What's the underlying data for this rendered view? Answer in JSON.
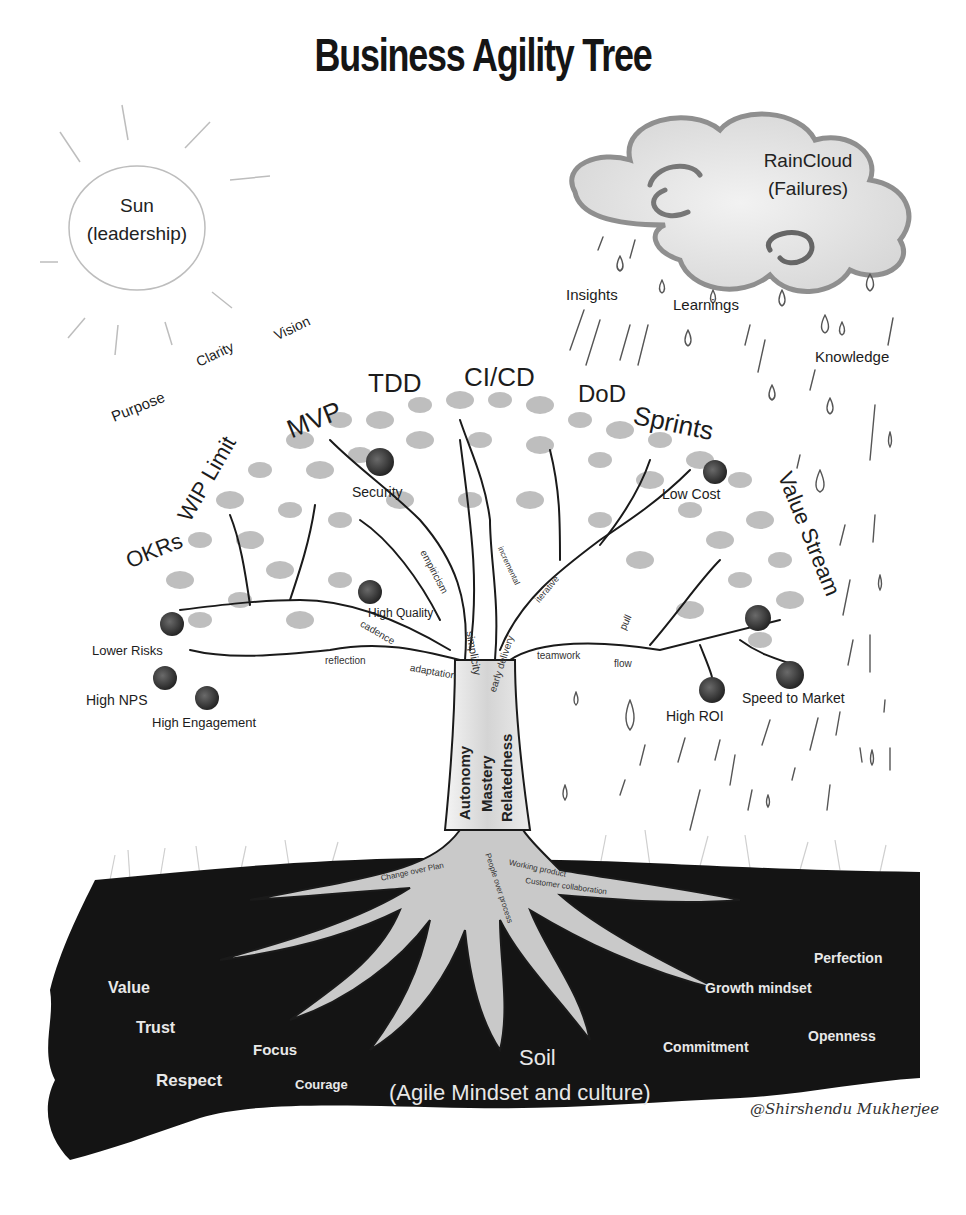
{
  "title": "Business Agility Tree",
  "colors": {
    "background": "#ffffff",
    "ink": "#1a1a1a",
    "foliage": "#a8a8a8",
    "fruit": "#333333",
    "soil": "#141414",
    "soil_text": "#e8e8e8",
    "root": "#c8c8c8"
  },
  "sun": {
    "line1": "Sun",
    "line2": "(leadership)"
  },
  "sun_rays_words": [
    "Purpose",
    "Clarity",
    "Vision"
  ],
  "cloud": {
    "line1": "RainCloud",
    "line2": "(Failures)"
  },
  "rain_words": [
    "Insights",
    "Learnings",
    "Knowledge"
  ],
  "canopy_practices": [
    "OKRs",
    "WIP Limit",
    "MVP",
    "TDD",
    "CI/CD",
    "DoD",
    "Sprints",
    "Value Stream"
  ],
  "fruits": [
    "Security",
    "High Quality",
    "Lower Risks",
    "High NPS",
    "High Engagement",
    "Low Cost",
    "High ROI",
    "Speed to Market"
  ],
  "branch_principles": [
    "empiricism",
    "cadence",
    "reflection",
    "adaptation",
    "simplicity",
    "early delivery",
    "incremental",
    "iterative",
    "teamwork",
    "flow",
    "pull"
  ],
  "trunk_motivators": [
    "Autonomy",
    "Mastery",
    "Relatedness"
  ],
  "root_values": [
    "Change over Plan",
    "People over process",
    "Working product",
    "Customer collaboration"
  ],
  "soil": {
    "title": "Soil",
    "subtitle": "(Agile Mindset and culture)",
    "values": [
      "Value",
      "Trust",
      "Respect",
      "Focus",
      "Courage",
      "Commitment",
      "Growth mindset",
      "Perfection",
      "Openness"
    ]
  },
  "signature": "@Shirshendu Mukherjee"
}
